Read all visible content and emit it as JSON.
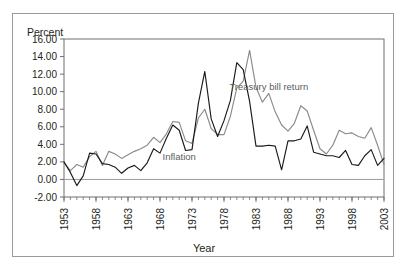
{
  "figure": {
    "y_axis_header": "Percent",
    "x_axis_title": "Year"
  },
  "chart_data": {
    "type": "line",
    "title": "",
    "subtitle": "",
    "xlabel": "Year",
    "ylabel": "Percent",
    "ylim": [
      -2.0,
      16.0
    ],
    "xlim": [
      1953,
      2003
    ],
    "ytick_labels": [
      "16.00",
      "14.00",
      "12.00",
      "10.00",
      "8.00",
      "6.00",
      "4.00",
      "2.00",
      "0.00",
      "-2.00"
    ],
    "ytick_values": [
      16.0,
      14.0,
      12.0,
      10.0,
      8.0,
      6.0,
      4.0,
      2.0,
      0.0,
      -2.0
    ],
    "xtick_labels": [
      "1953",
      "1958",
      "1963",
      "1968",
      "1973",
      "1978",
      "1983",
      "1988",
      "1993",
      "1998",
      "2003"
    ],
    "xtick_values": [
      1953,
      1958,
      1963,
      1968,
      1973,
      1978,
      1983,
      1988,
      1993,
      1998,
      2003
    ],
    "xtick_minor_step": 1,
    "grid": false,
    "legend_position": "inline-annotation",
    "annotations": [
      {
        "text": "Treasury bill return",
        "x": 1985,
        "y": 10.2,
        "series": "Treasury bill return"
      },
      {
        "text": "Inflation",
        "x": 1971,
        "y": 2.2,
        "series": "Inflation"
      }
    ],
    "x": [
      1953,
      1954,
      1955,
      1956,
      1957,
      1958,
      1959,
      1960,
      1961,
      1962,
      1963,
      1964,
      1965,
      1966,
      1967,
      1968,
      1969,
      1970,
      1971,
      1972,
      1973,
      1974,
      1975,
      1976,
      1977,
      1978,
      1979,
      1980,
      1981,
      1982,
      1983,
      1984,
      1985,
      1986,
      1987,
      1988,
      1989,
      1990,
      1991,
      1992,
      1993,
      1994,
      1995,
      1996,
      1997,
      1998,
      1999,
      2000,
      2001,
      2002,
      2003
    ],
    "series": [
      {
        "name": "Inflation",
        "color": "#1a1a1a",
        "values": [
          2.0,
          0.8,
          -0.7,
          0.4,
          3.0,
          2.9,
          1.8,
          1.7,
          1.4,
          0.7,
          1.3,
          1.6,
          1.0,
          1.9,
          3.5,
          3.0,
          4.7,
          6.2,
          5.6,
          3.3,
          3.4,
          8.7,
          12.3,
          6.9,
          4.9,
          6.7,
          9.0,
          13.3,
          12.5,
          8.9,
          3.8,
          3.8,
          3.9,
          3.8,
          1.1,
          4.4,
          4.4,
          4.6,
          6.1,
          3.1,
          2.9,
          2.7,
          2.7,
          2.5,
          3.3,
          1.7,
          1.6,
          2.7,
          3.4,
          1.6,
          2.4
        ]
      },
      {
        "name": "Treasury bill return",
        "color": "#8b8b8b",
        "values": [
          1.9,
          1.0,
          1.7,
          1.4,
          2.6,
          3.2,
          1.6,
          3.2,
          2.9,
          2.4,
          2.8,
          3.2,
          3.5,
          3.9,
          4.8,
          4.2,
          5.2,
          6.6,
          6.5,
          4.4,
          4.1,
          7.0,
          8.0,
          5.8,
          5.1,
          5.1,
          7.2,
          10.4,
          11.2,
          14.7,
          10.5,
          8.8,
          9.8,
          7.7,
          6.2,
          5.5,
          6.4,
          8.4,
          7.8,
          5.6,
          3.5,
          2.9,
          3.9,
          5.6,
          5.2,
          5.3,
          4.9,
          4.7,
          5.9,
          3.9,
          1.7
        ]
      }
    ]
  }
}
